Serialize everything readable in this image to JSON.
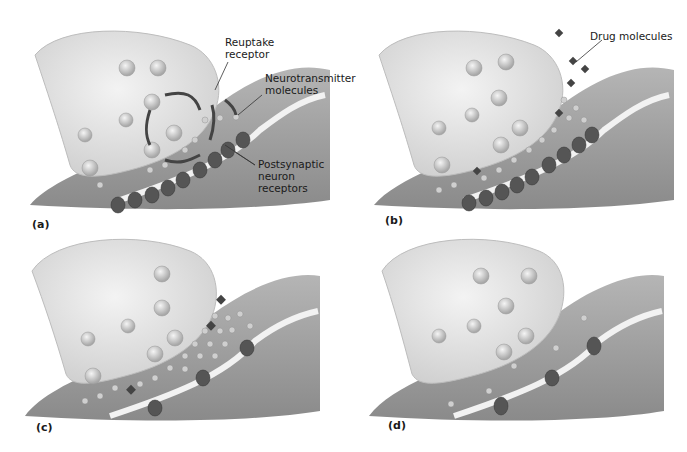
{
  "figure": {
    "panels": [
      {
        "id": "a",
        "letter": "(a)",
        "description": "Normal synapse: neurotransmitter released, binds postsynaptic receptors, recycled via reuptake receptor",
        "callouts": [
          {
            "text_line1": "Reuptake",
            "text_line2": "receptor"
          },
          {
            "text_line1": "Neurotransmitter",
            "text_line2": "molecules"
          },
          {
            "text_line1": "Postsynaptic",
            "text_line2": "neuron",
            "text_line3": "receptors"
          }
        ]
      },
      {
        "id": "b",
        "letter": "(b)",
        "description": "Drug molecules block reuptake receptors",
        "callouts": [
          {
            "text_line1": "Drug molecules"
          }
        ]
      },
      {
        "id": "c",
        "letter": "(c)",
        "description": "Excess neurotransmitter in cleft, fewer postsynaptic receptors"
      },
      {
        "id": "d",
        "letter": "(d)",
        "description": "Drug removed: little neurotransmitter, reduced receptors"
      }
    ],
    "colors": {
      "background": "#ffffff",
      "axon_terminal": "#e4e4e4",
      "postsynaptic": "#9a9a9a",
      "membrane": "#f2f2f2",
      "vesicle": "#d0d0d0",
      "receptor": "#5a5a5a",
      "text": "#1a1a1a"
    }
  }
}
